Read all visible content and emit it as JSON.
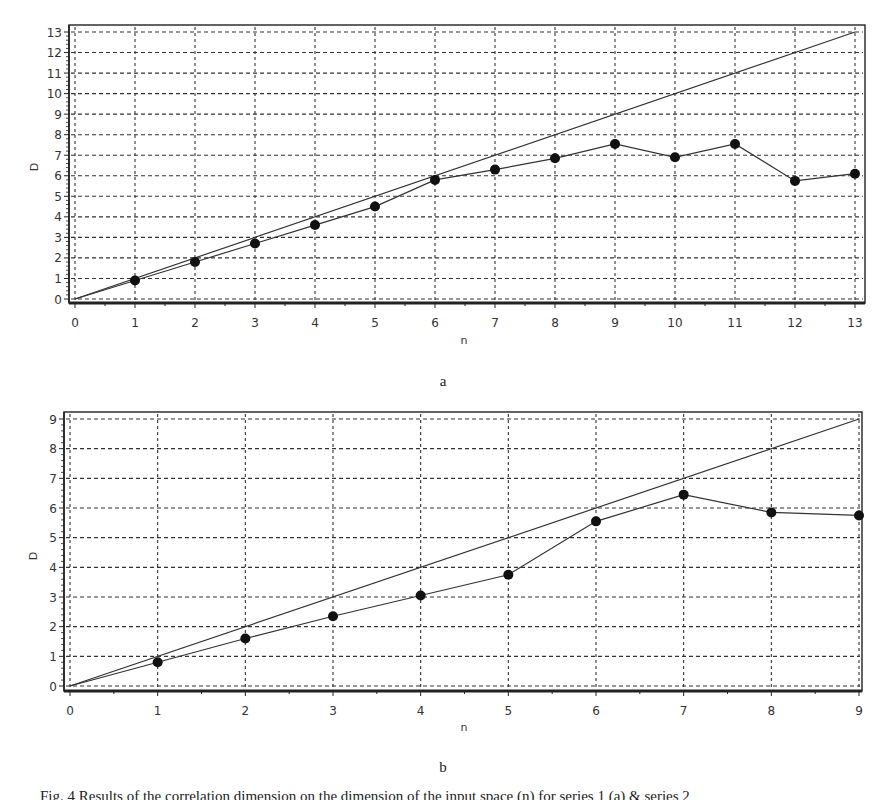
{
  "chart_data": [
    {
      "type": "line",
      "panel_label": "a",
      "title": "",
      "xlabel": "n",
      "ylabel": "D",
      "xlim": [
        0,
        13
      ],
      "ylim": [
        0,
        13
      ],
      "grid": true,
      "x_ticks": [
        0,
        1,
        2,
        3,
        4,
        5,
        6,
        7,
        8,
        9,
        10,
        11,
        12,
        13
      ],
      "y_ticks": [
        0,
        1,
        2,
        3,
        4,
        5,
        6,
        7,
        8,
        9,
        10,
        11,
        12,
        13
      ],
      "series": [
        {
          "name": "reference D = n",
          "marker": "none",
          "x": [
            0,
            13
          ],
          "values": [
            0,
            13
          ]
        },
        {
          "name": "D(n)",
          "marker": "filled-circle",
          "x": [
            0,
            1,
            2,
            3,
            4,
            5,
            6,
            7,
            8,
            9,
            10,
            11,
            12,
            13
          ],
          "values": [
            0,
            0.9,
            1.8,
            2.7,
            3.6,
            4.5,
            5.8,
            6.3,
            6.85,
            7.55,
            6.9,
            7.55,
            5.75,
            6.1
          ]
        }
      ]
    },
    {
      "type": "line",
      "panel_label": "b",
      "title": "",
      "xlabel": "n",
      "ylabel": "D",
      "xlim": [
        0,
        9
      ],
      "ylim": [
        0,
        9
      ],
      "grid": true,
      "x_ticks": [
        0,
        1,
        2,
        3,
        4,
        5,
        6,
        7,
        8,
        9
      ],
      "y_ticks": [
        0,
        1,
        2,
        3,
        4,
        5,
        6,
        7,
        8,
        9
      ],
      "series": [
        {
          "name": "reference D = n",
          "marker": "none",
          "x": [
            0,
            9
          ],
          "values": [
            0,
            9
          ]
        },
        {
          "name": "D(n)",
          "marker": "filled-circle",
          "x": [
            0,
            1,
            2,
            3,
            4,
            5,
            6,
            7,
            8,
            9
          ],
          "values": [
            0,
            0.8,
            1.6,
            2.35,
            3.05,
            3.75,
            5.55,
            6.45,
            5.85,
            5.75
          ]
        }
      ]
    }
  ],
  "layout": {
    "panels": [
      {
        "frame": [
          69,
          25,
          865,
          303
        ],
        "x0px": 75,
        "x1px": 855,
        "y0px": 299,
        "y1px": 32,
        "tick_label_y": 327,
        "xlabel_pos": [
          464,
          344
        ],
        "ylabel_pos": [
          38,
          167
        ],
        "panel_label_pos": [
          443,
          386
        ]
      },
      {
        "frame": [
          64,
          412,
          862,
          691
        ],
        "x0px": 70,
        "x1px": 859,
        "y0px": 686,
        "y1px": 419,
        "tick_label_y": 715,
        "xlabel_pos": [
          464,
          731
        ],
        "ylabel_pos": [
          37,
          556
        ],
        "panel_label_pos": [
          443,
          772
        ]
      }
    ],
    "colors": {
      "line": "#333333",
      "grid": "#333333",
      "frame": "#222222",
      "marker": "#111111"
    }
  },
  "caption": "Fig. 4 Results of the correlation dimension on the dimension of the input space (n) for series 1 (a) & series 2"
}
